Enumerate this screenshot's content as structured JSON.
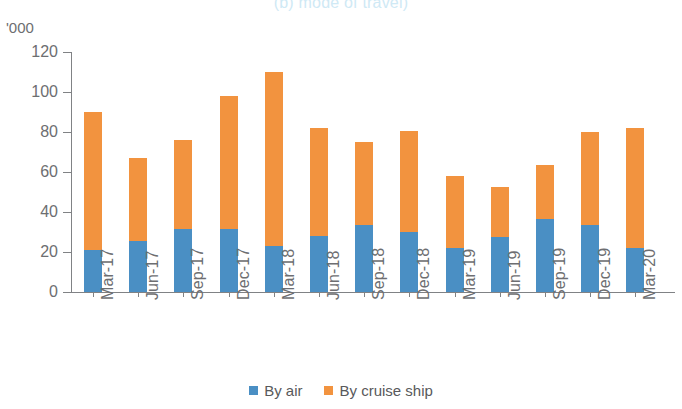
{
  "chart_data": {
    "type": "bar",
    "subtype": "stacked-column",
    "title": "(b) mode of travel)",
    "xlabel": "",
    "ylabel": "'000",
    "ylim": [
      0,
      120
    ],
    "yticks": [
      0,
      20,
      40,
      60,
      80,
      100,
      120
    ],
    "grid": false,
    "legend_position": "bottom-center",
    "categories": [
      "Mar-17",
      "Jun-17",
      "Sep-17",
      "Dec-17",
      "Mar-18",
      "Jun-18",
      "Sep-18",
      "Dec-18",
      "Mar-19",
      "Jun-19",
      "Sep-19",
      "Dec-19",
      "Mar-20"
    ],
    "series": [
      {
        "name": "By air",
        "color": "#4a8fc4",
        "values": [
          21,
          25.5,
          31.5,
          31.5,
          23,
          28,
          33.5,
          30,
          22,
          27.5,
          36.5,
          33.5,
          22
        ]
      },
      {
        "name": "By cruise ship",
        "color": "#f2933f",
        "values": [
          69,
          41.5,
          44.5,
          66.5,
          87,
          54,
          41.5,
          50.5,
          36,
          25,
          27,
          46.5,
          60
        ]
      }
    ],
    "totals": [
      90,
      67,
      76,
      98,
      110,
      82,
      75,
      80.5,
      58,
      52.5,
      63.5,
      80,
      82
    ]
  },
  "axis": {
    "unit_label": "'000",
    "tick_labels": [
      "120",
      "100",
      "80",
      "60",
      "40",
      "20",
      "0"
    ]
  },
  "legend": {
    "items": [
      {
        "label": "By air",
        "color": "#4a8fc4",
        "swatch": "square-swatch-blue"
      },
      {
        "label": "By cruise ship",
        "color": "#f2933f",
        "swatch": "square-swatch-orange"
      }
    ]
  },
  "colors": {
    "air": "#4a8fc4",
    "cruise": "#f2933f",
    "axis": "#808285",
    "text": "#6d6e71",
    "title": "#cfe9f5",
    "background": "#ffffff"
  }
}
